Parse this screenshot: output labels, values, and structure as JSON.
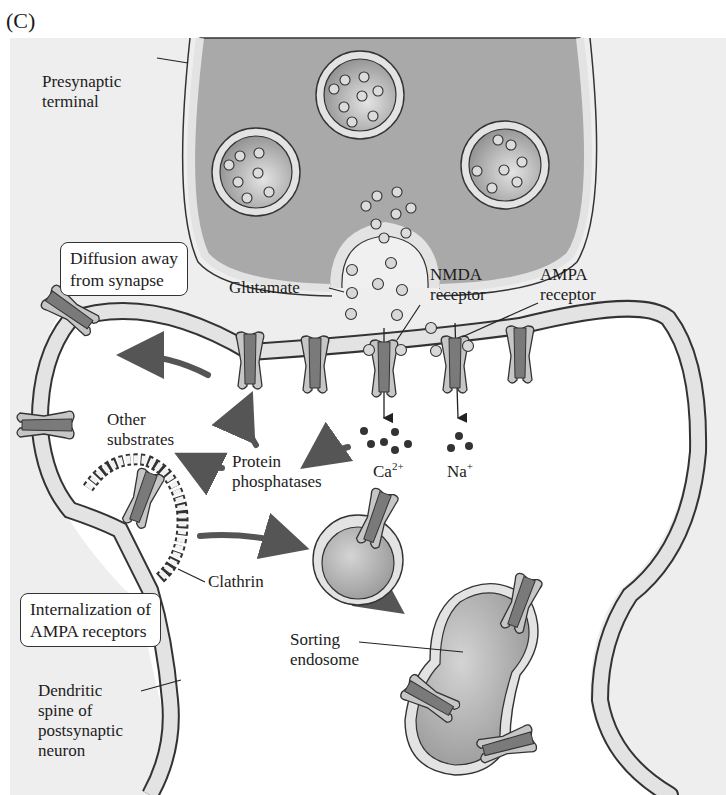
{
  "figure": {
    "panel_label": "(C)",
    "colors": {
      "background_field": "#eeeeee",
      "terminal_fill": "#a9a9a9",
      "membrane_fill": "#e3e3e3",
      "receptor_light": "#c6c6c6",
      "receptor_dark": "#777777",
      "arrow": "#555555",
      "ion_dot": "#333333",
      "glutamate_dot": "#d8d8d8"
    }
  },
  "labels": {
    "presynaptic_terminal": "Presynaptic\nterminal",
    "glutamate": "Glutamate",
    "nmda_receptor": "NMDA\nreceptor",
    "ampa_receptor": "AMPA\nreceptor",
    "other_substrates": "Other\nsubstrates",
    "protein_phosphatases": "Protein\nphosphatases",
    "calcium_ion": "Ca",
    "calcium_charge": "2+",
    "sodium_ion": "Na",
    "sodium_charge": "+",
    "clathrin": "Clathrin",
    "sorting_endosome": "Sorting\nendosome",
    "dendritic_spine": "Dendritic\nspine of\npostsynaptic\nneuron"
  },
  "boxes": {
    "diffusion": "Diffusion away\nfrom synapse",
    "internalization": "Internalization of\nAMPA receptors"
  }
}
